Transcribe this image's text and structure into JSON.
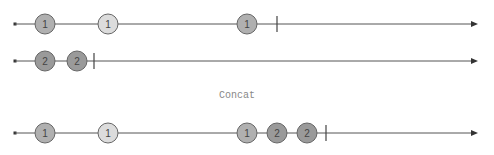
{
  "diagram": {
    "title": "Concat",
    "colors": {
      "line": "#555555",
      "dark_marble": "#a8a8a8",
      "light_marble": "#d8d8d8",
      "marble_stroke": "#666666",
      "text": "#444444",
      "label": "#888888"
    },
    "timelines": [
      {
        "name": "source-1",
        "y": 24,
        "start_x": 15,
        "end_x": 478,
        "complete_x": 277,
        "marbles": [
          {
            "x": 45,
            "label": "1",
            "shade": "dark"
          },
          {
            "x": 108,
            "label": "1",
            "shade": "light"
          },
          {
            "x": 247,
            "label": "1",
            "shade": "dark"
          }
        ]
      },
      {
        "name": "source-2",
        "y": 61,
        "start_x": 15,
        "end_x": 478,
        "complete_x": 94,
        "marbles": [
          {
            "x": 45,
            "label": "2",
            "shade": "darker"
          },
          {
            "x": 77,
            "label": "2",
            "shade": "darker"
          }
        ]
      },
      {
        "name": "result",
        "y": 133,
        "start_x": 15,
        "end_x": 478,
        "complete_x": 326,
        "marbles": [
          {
            "x": 45,
            "label": "1",
            "shade": "dark"
          },
          {
            "x": 108,
            "label": "1",
            "shade": "light"
          },
          {
            "x": 247,
            "label": "1",
            "shade": "dark"
          },
          {
            "x": 277,
            "label": "2",
            "shade": "darker"
          },
          {
            "x": 307,
            "label": "2",
            "shade": "darker"
          }
        ]
      }
    ]
  }
}
